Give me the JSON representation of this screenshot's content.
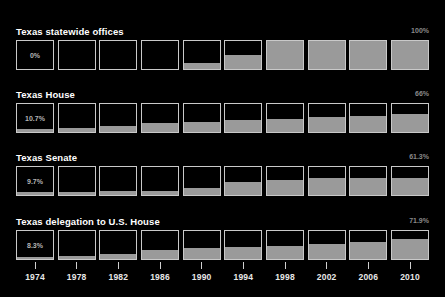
{
  "chart_data": {
    "type": "bar",
    "title": "",
    "xlabel": "",
    "ylabel": "",
    "ylim": [
      0,
      100
    ],
    "grid": false,
    "legend": "none",
    "categories": [
      "1974",
      "1978",
      "1982",
      "1986",
      "1990",
      "1994",
      "1998",
      "2002",
      "2006",
      "2010"
    ],
    "series": [
      {
        "name": "Texas statewide offices",
        "start_label": "0%",
        "end_label": "100%",
        "values": [
          0,
          0,
          0,
          0,
          20,
          50,
          100,
          100,
          100,
          100
        ]
      },
      {
        "name": "Texas House",
        "start_label": "10.7%",
        "end_label": "66%",
        "values": [
          10.7,
          13,
          23,
          32,
          36,
          42,
          46,
          55,
          58,
          66
        ]
      },
      {
        "name": "Texas Senate",
        "start_label": "9.7%",
        "end_label": "61.3%",
        "values": [
          9.7,
          10,
          13,
          16,
          26,
          45,
          55,
          61.3,
          61.3,
          61.3
        ]
      },
      {
        "name": "Texas delegation to U.S. House",
        "start_label": "8.3%",
        "end_label": "71.9%",
        "values": [
          8.3,
          12,
          17,
          33,
          38,
          42,
          48,
          52,
          62,
          71.9
        ]
      }
    ]
  },
  "colors": {
    "background": "#000000",
    "fill": "#9a9a9a",
    "cell_border": "#c9c9c9",
    "title_text": "#ffffff",
    "end_label_text": "#8a8a8a",
    "value_text": "#b4b4b4",
    "axis_text": "#e8e8e8"
  },
  "panels": [
    {
      "title": "Texas statewide offices",
      "end_label": "100%",
      "cells": [
        {
          "year": "1974",
          "pct": 0,
          "label": "0%"
        },
        {
          "year": "1978",
          "pct": 0,
          "label": ""
        },
        {
          "year": "1982",
          "pct": 0,
          "label": ""
        },
        {
          "year": "1986",
          "pct": 0,
          "label": ""
        },
        {
          "year": "1990",
          "pct": 20,
          "label": ""
        },
        {
          "year": "1994",
          "pct": 50,
          "label": ""
        },
        {
          "year": "1998",
          "pct": 100,
          "label": ""
        },
        {
          "year": "2002",
          "pct": 100,
          "label": ""
        },
        {
          "year": "2006",
          "pct": 100,
          "label": ""
        },
        {
          "year": "2010",
          "pct": 100,
          "label": ""
        }
      ]
    },
    {
      "title": "Texas House",
      "end_label": "66%",
      "cells": [
        {
          "year": "1974",
          "pct": 10.7,
          "label": "10.7%"
        },
        {
          "year": "1978",
          "pct": 13,
          "label": ""
        },
        {
          "year": "1982",
          "pct": 23,
          "label": ""
        },
        {
          "year": "1986",
          "pct": 32,
          "label": ""
        },
        {
          "year": "1990",
          "pct": 36,
          "label": ""
        },
        {
          "year": "1994",
          "pct": 42,
          "label": ""
        },
        {
          "year": "1998",
          "pct": 46,
          "label": ""
        },
        {
          "year": "2002",
          "pct": 55,
          "label": ""
        },
        {
          "year": "2006",
          "pct": 58,
          "label": ""
        },
        {
          "year": "2010",
          "pct": 66,
          "label": ""
        }
      ]
    },
    {
      "title": "Texas Senate",
      "end_label": "61.3%",
      "cells": [
        {
          "year": "1974",
          "pct": 9.7,
          "label": "9.7%"
        },
        {
          "year": "1978",
          "pct": 10,
          "label": ""
        },
        {
          "year": "1982",
          "pct": 13,
          "label": ""
        },
        {
          "year": "1986",
          "pct": 16,
          "label": ""
        },
        {
          "year": "1990",
          "pct": 26,
          "label": ""
        },
        {
          "year": "1994",
          "pct": 45,
          "label": ""
        },
        {
          "year": "1998",
          "pct": 55,
          "label": ""
        },
        {
          "year": "2002",
          "pct": 61.3,
          "label": ""
        },
        {
          "year": "2006",
          "pct": 61.3,
          "label": ""
        },
        {
          "year": "2010",
          "pct": 61.3,
          "label": ""
        }
      ]
    },
    {
      "title": "Texas delegation to U.S. House",
      "end_label": "71.9%",
      "cells": [
        {
          "year": "1974",
          "pct": 8.3,
          "label": "8.3%"
        },
        {
          "year": "1978",
          "pct": 12,
          "label": ""
        },
        {
          "year": "1982",
          "pct": 17,
          "label": ""
        },
        {
          "year": "1986",
          "pct": 33,
          "label": ""
        },
        {
          "year": "1990",
          "pct": 38,
          "label": ""
        },
        {
          "year": "1994",
          "pct": 42,
          "label": ""
        },
        {
          "year": "1998",
          "pct": 48,
          "label": ""
        },
        {
          "year": "2002",
          "pct": 52,
          "label": ""
        },
        {
          "year": "2006",
          "pct": 62,
          "label": ""
        },
        {
          "year": "2010",
          "pct": 71.9,
          "label": ""
        }
      ]
    }
  ],
  "axis": {
    "ticks": [
      "1974",
      "1978",
      "1982",
      "1986",
      "1990",
      "1994",
      "1998",
      "2002",
      "2006",
      "2010"
    ]
  }
}
